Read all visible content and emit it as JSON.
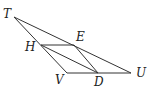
{
  "diagram": {
    "points": {
      "T": {
        "label": "T",
        "x": 14,
        "y": 17,
        "lx": 3,
        "ly": 18
      },
      "H": {
        "label": "H",
        "x": 41,
        "y": 45,
        "lx": 25,
        "ly": 51
      },
      "E": {
        "label": "E",
        "x": 74,
        "y": 45,
        "lx": 76,
        "ly": 41
      },
      "V": {
        "label": "V",
        "x": 67,
        "y": 73,
        "lx": 55,
        "ly": 84
      },
      "D": {
        "label": "D",
        "x": 98,
        "y": 73,
        "lx": 94,
        "ly": 86
      },
      "U": {
        "label": "U",
        "x": 131,
        "y": 73,
        "lx": 136,
        "ly": 77
      }
    },
    "segments": [
      [
        "T",
        "U"
      ],
      [
        "T",
        "V"
      ],
      [
        "V",
        "U"
      ],
      [
        "H",
        "E"
      ],
      [
        "E",
        "D"
      ],
      [
        "H",
        "D"
      ]
    ]
  }
}
